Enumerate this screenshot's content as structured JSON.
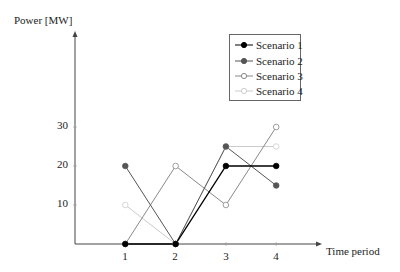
{
  "chart_data": {
    "type": "line",
    "title": "",
    "xlabel": "Time period",
    "ylabel": "Power [MW]",
    "x": [
      1,
      2,
      3,
      4
    ],
    "x_tick_labels": [
      "1",
      "2",
      "3",
      "4"
    ],
    "y_tick_labels": [
      "10",
      "20",
      "30"
    ],
    "y_ticks": [
      10,
      20,
      30
    ],
    "ylim": [
      0,
      45
    ],
    "xlim": [
      0,
      5.5
    ],
    "grid": false,
    "legend_position": "upper right",
    "series": [
      {
        "name": "Scenario 1",
        "values": [
          0,
          0,
          20,
          20
        ],
        "color": "#000000",
        "marker": "filled-circle"
      },
      {
        "name": "Scenario 2",
        "values": [
          20,
          0,
          25,
          15
        ],
        "color": "#555555",
        "marker": "filled-circle"
      },
      {
        "name": "Scenario 3",
        "values": [
          0,
          20,
          10,
          30
        ],
        "color": "#888888",
        "marker": "open-circle"
      },
      {
        "name": "Scenario 4",
        "values": [
          10,
          0,
          25,
          25
        ],
        "color": "#cccccc",
        "marker": "open-circle"
      }
    ]
  },
  "labels": {
    "ylabel": "Power [MW]",
    "xlabel": "Time period",
    "x_ticks": [
      "1",
      "2",
      "3",
      "4"
    ],
    "y_ticks": [
      "10",
      "20",
      "30"
    ]
  },
  "legend": {
    "items": [
      "Scenario 1",
      "Scenario 2",
      "Scenario 3",
      "Scenario 4"
    ]
  }
}
